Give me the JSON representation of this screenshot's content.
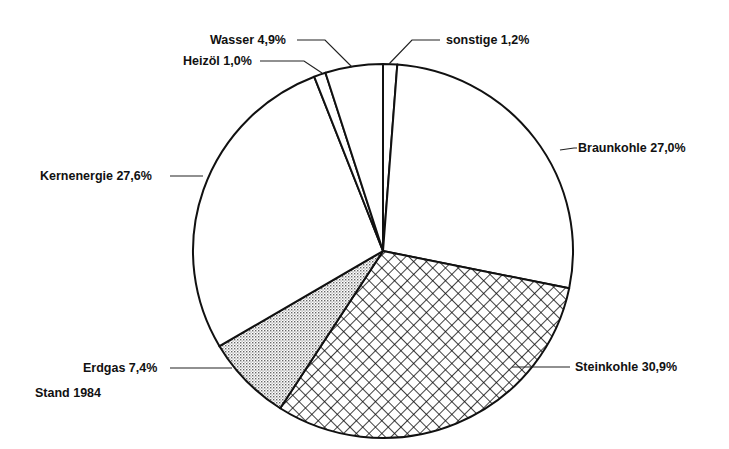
{
  "chart_data": {
    "type": "pie",
    "title": "",
    "annotation": "Stand 1984",
    "start_angle_deg": 0,
    "direction": "clockwise",
    "slices": [
      {
        "label": "sonstige",
        "value": 1.2,
        "display": "sonstige 1,2%",
        "fill": "white"
      },
      {
        "label": "Braunkohle",
        "value": 27.0,
        "display": "Braunkohle 27,0%",
        "fill": "white"
      },
      {
        "label": "Steinkohle",
        "value": 30.9,
        "display": "Steinkohle 30,9%",
        "fill": "crosshatch"
      },
      {
        "label": "Erdgas",
        "value": 7.4,
        "display": "Erdgas 7,4%",
        "fill": "dots"
      },
      {
        "label": "Kernenergie",
        "value": 27.6,
        "display": "Kernenergie 27,6%",
        "fill": "white"
      },
      {
        "label": "Heizöl",
        "value": 1.0,
        "display": "Heizöl 1,0%",
        "fill": "white"
      },
      {
        "label": "Wasser",
        "value": 4.9,
        "display": "Wasser 4,9%",
        "fill": "white"
      }
    ]
  },
  "labels": {
    "sonstige": "sonstige 1,2%",
    "braunkohle": "Braunkohle 27,0%",
    "steinkohle": "Steinkohle 30,9%",
    "erdgas": "Erdgas 7,4%",
    "kernenergie": "Kernenergie 27,6%",
    "heizoel": "Heizöl 1,0%",
    "wasser": "Wasser 4,9%",
    "stand": "Stand 1984"
  },
  "colors": {
    "ink": "#111111",
    "background": "#ffffff"
  }
}
